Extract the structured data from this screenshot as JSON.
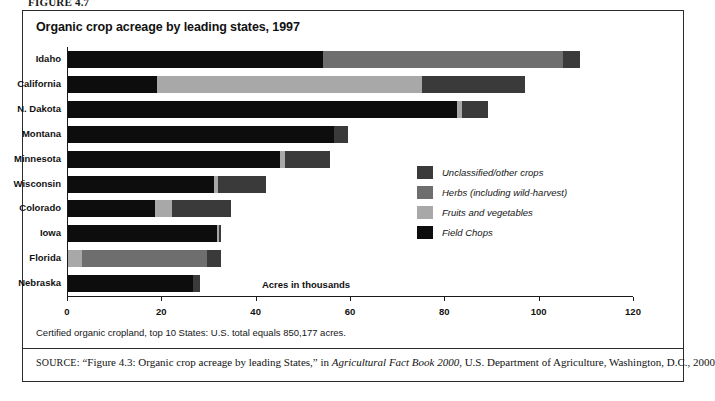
{
  "figure_label": "FIGURE 4.7",
  "chart": {
    "title": "Organic crop acreage by leading states, 1997",
    "footnote": "Certified organic cropland, top 10 States: U.S. total equals 850,177 acres.",
    "source_prefix": "SOURCE:",
    "source_part1": "“Figure 4.3: Organic crop acreage by leading States,” in ",
    "source_italic": "Agricultural Fact Book 2000",
    "source_part2": ", U.S. Department of Agriculture, Washington, D.C., 2000"
  },
  "chart_data": {
    "type": "bar",
    "orientation": "horizontal",
    "stacked": true,
    "title": "Organic crop acreage by leading states, 1997",
    "xlabel": "Acres in thousands",
    "ylabel": "",
    "xlim": [
      0,
      120
    ],
    "xticks": [
      0,
      20,
      40,
      60,
      80,
      100,
      120
    ],
    "grid": false,
    "legend_position": "inside-right",
    "categories": [
      "Idaho",
      "California",
      "N. Dakota",
      "Montana",
      "Minnesota",
      "Wisconsin",
      "Colorado",
      "Iowa",
      "Florida",
      "Nebraska"
    ],
    "series": [
      {
        "name": "Field Chops",
        "color": "#0d0d0d",
        "values": [
          54.0,
          18.8,
          82.5,
          56.5,
          45.0,
          31.0,
          18.5,
          31.5,
          0.0,
          26.5
        ]
      },
      {
        "name": "Fruits and vegetables",
        "color": "#a8a8a8",
        "values": [
          0.0,
          56.2,
          1.0,
          0.0,
          1.0,
          0.8,
          3.5,
          0.5,
          3.0,
          0.0
        ]
      },
      {
        "name": "Herbs (including wild-harvest)",
        "color": "#6e6e6e",
        "values": [
          51.0,
          0.0,
          0.0,
          0.0,
          0.0,
          0.0,
          0.0,
          0.0,
          26.5,
          0.0
        ]
      },
      {
        "name": "Unclassified/other crops",
        "color": "#3a3a3a",
        "values": [
          3.5,
          21.8,
          5.5,
          2.8,
          9.5,
          10.2,
          12.5,
          0.5,
          3.0,
          1.5
        ]
      }
    ],
    "totals": [
      108.5,
      96.8,
      89.0,
      59.3,
      55.5,
      42.0,
      34.5,
      32.5,
      32.5,
      28.0
    ],
    "bars": [
      {
        "category": "Idaho",
        "segments": [
          {
            "series": "Field Chops",
            "value": 54.0
          },
          {
            "series": "Herbs (including wild-harvest)",
            "value": 51.0
          },
          {
            "series": "Unclassified/other crops",
            "value": 3.5
          }
        ]
      },
      {
        "category": "California",
        "segments": [
          {
            "series": "Field Chops",
            "value": 18.8
          },
          {
            "series": "Fruits and vegetables",
            "value": 56.2
          },
          {
            "series": "Unclassified/other crops",
            "value": 21.8
          }
        ]
      },
      {
        "category": "N. Dakota",
        "segments": [
          {
            "series": "Field Chops",
            "value": 82.5
          },
          {
            "series": "Fruits and vegetables",
            "value": 1.0
          },
          {
            "series": "Unclassified/other crops",
            "value": 5.5
          }
        ]
      },
      {
        "category": "Montana",
        "segments": [
          {
            "series": "Field Chops",
            "value": 56.5
          },
          {
            "series": "Unclassified/other crops",
            "value": 2.8
          }
        ]
      },
      {
        "category": "Minnesota",
        "segments": [
          {
            "series": "Field Chops",
            "value": 45.0
          },
          {
            "series": "Fruits and vegetables",
            "value": 1.0
          },
          {
            "series": "Unclassified/other crops",
            "value": 9.5
          }
        ]
      },
      {
        "category": "Wisconsin",
        "segments": [
          {
            "series": "Field Chops",
            "value": 31.0
          },
          {
            "series": "Fruits and vegetables",
            "value": 0.8
          },
          {
            "series": "Unclassified/other crops",
            "value": 10.2
          }
        ]
      },
      {
        "category": "Colorado",
        "segments": [
          {
            "series": "Field Chops",
            "value": 18.5
          },
          {
            "series": "Fruits and vegetables",
            "value": 3.5
          },
          {
            "series": "Unclassified/other crops",
            "value": 12.5
          }
        ]
      },
      {
        "category": "Iowa",
        "segments": [
          {
            "series": "Field Chops",
            "value": 31.5
          },
          {
            "series": "Fruits and vegetables",
            "value": 0.5
          },
          {
            "series": "Unclassified/other crops",
            "value": 0.5
          }
        ]
      },
      {
        "category": "Florida",
        "segments": [
          {
            "series": "Fruits and vegetables",
            "value": 3.0
          },
          {
            "series": "Herbs (including wild-harvest)",
            "value": 26.5
          },
          {
            "series": "Unclassified/other crops",
            "value": 3.0
          }
        ]
      },
      {
        "category": "Nebraska",
        "segments": [
          {
            "series": "Field Chops",
            "value": 26.5
          },
          {
            "series": "Unclassified/other crops",
            "value": 1.5
          }
        ]
      }
    ],
    "legend": [
      {
        "label": "Unclassified/other crops",
        "color": "#3a3a3a"
      },
      {
        "label": "Herbs (including wild-harvest)",
        "color": "#6e6e6e"
      },
      {
        "label": "Fruits and vegetables",
        "color": "#a8a8a8"
      },
      {
        "label": "Field Chops",
        "color": "#0d0d0d"
      }
    ]
  }
}
